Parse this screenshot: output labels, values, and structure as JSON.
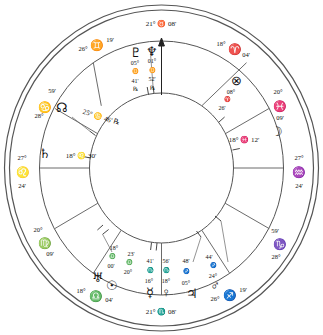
{
  "chart": {
    "type": "astrological-natal-wheel",
    "house_system_note": "",
    "geometry": {
      "cx": 161.5,
      "cy": 168,
      "r_outer": 158,
      "r_outer_inner": 152,
      "r_zodiac_inner": 120,
      "r_house_inner": 72
    },
    "angles": {
      "ascendant": {
        "label": "ASC",
        "deg": "27°",
        "sign": "♌",
        "min": "24'"
      },
      "descendant": {
        "label": "DSC",
        "deg": "27°",
        "sign": "♒",
        "min": "24'"
      },
      "midheaven": {
        "label": "MC",
        "text": "21° ♉ 08'",
        "deg": "21°",
        "sign": "♉",
        "min": "08'"
      },
      "imum_coeli": {
        "label": "IC",
        "text": "21° ♏ 08'",
        "deg": "21°",
        "sign": "♏",
        "min": "08'"
      }
    },
    "cusps": [
      {
        "house": 1,
        "deg": "27°",
        "sign": "♌",
        "min": "24'",
        "angle_deg": 180
      },
      {
        "house": 2,
        "deg": "20°",
        "sign": "♍",
        "min": "09'",
        "angle_deg": 208
      },
      {
        "house": 3,
        "deg": "18°",
        "sign": "♎",
        "min": "04'",
        "angle_deg": 236
      },
      {
        "house": 4,
        "deg": "21°",
        "sign": "♏",
        "min": "08'",
        "angle_deg": 270
      },
      {
        "house": 5,
        "deg": "26°",
        "sign": "♐",
        "min": "19'",
        "angle_deg": 304
      },
      {
        "house": 6,
        "deg": "28°",
        "sign": "♑",
        "min": "59'",
        "angle_deg": 332
      },
      {
        "house": 7,
        "deg": "27°",
        "sign": "♒",
        "min": "24'",
        "angle_deg": 0
      },
      {
        "house": 8,
        "deg": "20°",
        "sign": "♓",
        "min": "09'",
        "angle_deg": 28
      },
      {
        "house": 9,
        "deg": "18°",
        "sign": "♈",
        "min": "04'",
        "angle_deg": 56
      },
      {
        "house": 10,
        "deg": "21°",
        "sign": "♉",
        "min": "08'",
        "angle_deg": 90
      },
      {
        "house": 11,
        "deg": "26°",
        "sign": "♊",
        "min": "19'",
        "angle_deg": 124
      },
      {
        "house": 12,
        "deg": "28°",
        "sign": "♋",
        "min": "59'",
        "angle_deg": 152
      }
    ],
    "planets": [
      {
        "name": "pluto",
        "glyph": "♇",
        "deg": "05°",
        "sign": "♊",
        "min": "41'",
        "retrograde": "℞"
      },
      {
        "name": "neptune",
        "glyph": "♆",
        "deg": "01°",
        "sign": "♊",
        "min": "52'",
        "retrograde": "℞"
      },
      {
        "name": "part-of-fortune",
        "glyph": "⊗",
        "deg": "08°",
        "sign": "♈",
        "min": "26'",
        "retrograde": ""
      },
      {
        "name": "moon",
        "glyph": "☽",
        "deg": "18°",
        "sign": "♓",
        "min": "12'",
        "retrograde": ""
      },
      {
        "name": "north-node",
        "glyph": "☊",
        "deg": "25°",
        "sign": "♋",
        "min": "46'",
        "retrograde": "℞"
      },
      {
        "name": "saturn",
        "glyph": "♄",
        "deg": "18°",
        "sign": "♌",
        "min": "30'",
        "retrograde": ""
      },
      {
        "name": "uranus",
        "glyph": "♅",
        "deg": "18°",
        "sign": "♎",
        "min": "00'",
        "retrograde": ""
      },
      {
        "name": "sun",
        "glyph": "☉",
        "deg": "20°",
        "sign": "♎",
        "min": "23'",
        "retrograde": ""
      },
      {
        "name": "mercury",
        "glyph": "☿",
        "deg": "16°",
        "sign": "♏",
        "min": "41'",
        "retrograde": ""
      },
      {
        "name": "venus",
        "glyph": "♀",
        "deg": "18°",
        "sign": "♏",
        "min": "56'",
        "retrograde": ""
      },
      {
        "name": "jupiter",
        "glyph": "♃",
        "deg": "05°",
        "sign": "♐",
        "min": "48'",
        "retrograde": ""
      },
      {
        "name": "mars",
        "glyph": "♂",
        "deg": "24°",
        "sign": "♐",
        "min": "44'",
        "retrograde": ""
      }
    ],
    "labels": {
      "mc_text": "21° ♉ 08'",
      "ic_text": "21° ♏ 08'",
      "moon_text": "18° ♓ 12'",
      "saturn_text": "18° ♌ 30'",
      "node_text": "25° ♋ 46' ℞",
      "cusp11_deg": "26°",
      "cusp11_sign": "♊",
      "cusp11_min": "19'",
      "cusp12_deg": "28°",
      "cusp12_sign": "♋",
      "cusp12_min": "59'",
      "cusp9_deg": "18°",
      "cusp9_sign": "♈",
      "cusp9_min": "04'",
      "cusp8_deg": "20°",
      "cusp8_sign": "♓",
      "cusp8_min": "09'",
      "cusp7_deg": "27°",
      "cusp7_sign": "♒",
      "cusp7_min": "24'",
      "cusp6_deg": "28°",
      "cusp6_sign": "♑",
      "cusp6_min": "59'",
      "cusp5_deg": "26°",
      "cusp5_sign": "♐",
      "cusp5_min": "19'",
      "cusp3_deg": "18°",
      "cusp3_sign": "♎",
      "cusp3_min": "04'",
      "cusp2_deg": "20°",
      "cusp2_sign": "♍",
      "cusp2_min": "09'",
      "cusp1_deg": "27°",
      "cusp1_sign": "♌",
      "cusp1_min": "24'",
      "pof_deg": "08°",
      "pof_sign": "♈",
      "pof_min": "26'",
      "pluto_deg": "05°",
      "pluto_sign": "♊",
      "pluto_min": "41'",
      "pluto_r": "℞",
      "neptune_deg": "01°",
      "neptune_sign": "♊",
      "neptune_min": "52'",
      "neptune_r": "℞",
      "uranus_deg": "18°",
      "uranus_sign": "♎",
      "uranus_min": "00'",
      "sun_deg": "20°",
      "sun_sign": "♎",
      "sun_min": "23'",
      "mercury_deg": "16°",
      "mercury_sign": "♏",
      "mercury_min": "41'",
      "venus_deg": "18°",
      "venus_sign": "♏",
      "venus_min": "56'",
      "jupiter_deg": "05°",
      "jupiter_sign": "♐",
      "jupiter_min": "48'",
      "mars_deg": "24°",
      "mars_sign": "♐",
      "mars_min": "44'"
    },
    "colors": {
      "line": "#4a4a4a",
      "ring": "#555555",
      "text": "#111111",
      "background": "#ffffff"
    }
  }
}
